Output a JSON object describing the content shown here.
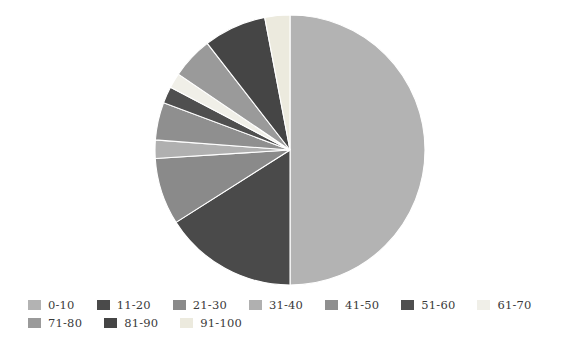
{
  "chart_data": {
    "type": "pie",
    "title": "",
    "subtitle": "",
    "xlabel": "",
    "ylabel": "",
    "grid": false,
    "legend_position": "bottom",
    "start_angle_deg": 90,
    "direction": "clockwise",
    "center": {
      "x": 290,
      "y": 150
    },
    "radius": 135,
    "categories": [
      "0-10",
      "11-20",
      "21-30",
      "31-40",
      "41-50",
      "51-60",
      "61-70",
      "71-80",
      "81-90",
      "91-100"
    ],
    "values": [
      50.0,
      16.0,
      8.0,
      2.2,
      4.5,
      2.0,
      1.8,
      5.0,
      7.5,
      3.0
    ],
    "slices": [
      {
        "label": "0-10",
        "value": 50.0,
        "color": "#b3b3b3",
        "start_deg": 0.0,
        "end_deg": 180.0
      },
      {
        "label": "11-20",
        "value": 16.0,
        "color": "#4a4a4a",
        "start_deg": 180.0,
        "end_deg": 237.6
      },
      {
        "label": "21-30",
        "value": 8.0,
        "color": "#8a8a8a",
        "start_deg": 237.6,
        "end_deg": 266.4
      },
      {
        "label": "31-40",
        "value": 2.2,
        "color": "#b0b0b0",
        "start_deg": 266.4,
        "end_deg": 274.3
      },
      {
        "label": "41-50",
        "value": 4.5,
        "color": "#8f8f8f",
        "start_deg": 274.3,
        "end_deg": 290.5
      },
      {
        "label": "51-60",
        "value": 2.0,
        "color": "#4f4f4f",
        "start_deg": 290.5,
        "end_deg": 297.7
      },
      {
        "label": "61-70",
        "value": 1.8,
        "color": "#f0efe8",
        "start_deg": 297.7,
        "end_deg": 304.2
      },
      {
        "label": "71-80",
        "value": 5.0,
        "color": "#9a9a9a",
        "start_deg": 304.2,
        "end_deg": 322.2
      },
      {
        "label": "81-90",
        "value": 7.5,
        "color": "#454545",
        "start_deg": 322.2,
        "end_deg": 349.2
      },
      {
        "label": "91-100",
        "value": 3.0,
        "color": "#eceade",
        "start_deg": 349.2,
        "end_deg": 360.0
      }
    ]
  },
  "legend": {
    "rows": [
      [
        {
          "label": "0-10",
          "color": "#b3b3b3"
        },
        {
          "label": "11-20",
          "color": "#4a4a4a"
        },
        {
          "label": "21-30",
          "color": "#8a8a8a"
        },
        {
          "label": "31-40",
          "color": "#b0b0b0"
        },
        {
          "label": "41-50",
          "color": "#8f8f8f"
        },
        {
          "label": "51-60",
          "color": "#4f4f4f"
        },
        {
          "label": "61-70",
          "color": "#f0efe8"
        }
      ],
      [
        {
          "label": "71-80",
          "color": "#9a9a9a"
        },
        {
          "label": "81-90",
          "color": "#454545"
        },
        {
          "label": "91-100",
          "color": "#eceade"
        }
      ]
    ]
  }
}
